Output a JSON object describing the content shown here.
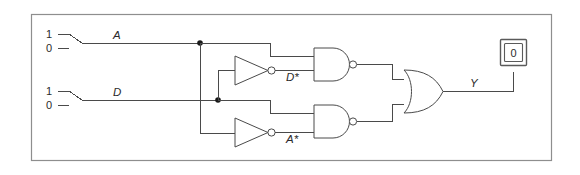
{
  "figure": {
    "frame_color": "#8e8e8e",
    "wire_color": "#4a4a4a",
    "background": "#ffffff"
  },
  "inputs": [
    {
      "name": "A",
      "label": "A",
      "high_label": "1",
      "low_label": "0",
      "position": "1",
      "value": "1"
    },
    {
      "name": "D",
      "label": "D",
      "high_label": "1",
      "low_label": "0",
      "position": "1",
      "value": "1"
    }
  ],
  "internal_signals": [
    {
      "name": "D-not",
      "label": "D*"
    },
    {
      "name": "A-not",
      "label": "A*"
    }
  ],
  "output": {
    "label": "Y",
    "indicator_value": "0"
  },
  "gates": [
    {
      "name": "inverter-top",
      "type": "NOT",
      "output_label": "D*"
    },
    {
      "name": "inverter-bottom",
      "type": "NOT",
      "output_label": "A*"
    },
    {
      "name": "nand-top",
      "type": "NAND"
    },
    {
      "name": "nand-bottom",
      "type": "NAND"
    },
    {
      "name": "or-output",
      "type": "OR"
    }
  ]
}
